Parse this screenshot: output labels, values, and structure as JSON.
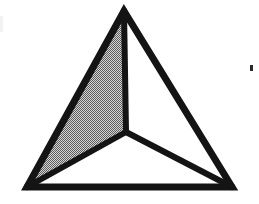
{
  "figure": {
    "background_color": "#ffffff",
    "stroke_color": "#141414",
    "stroke_width": 7,
    "shaded_face_fill": "#9a9a9a",
    "shaded_face_pattern": "dithered-halftone-50-percent",
    "unshaded_face_fill": "#ffffff",
    "canvas": {
      "width": 259,
      "height": 204
    }
  },
  "geometry": {
    "vertices": {
      "apex": {
        "label": "apex",
        "x": 124,
        "y": 11
      },
      "bottom_left": {
        "label": "bottom-left",
        "x": 27,
        "y": 187
      },
      "bottom_right": {
        "label": "bottom-right",
        "x": 232,
        "y": 187
      },
      "interior": {
        "label": "interior",
        "x": 126,
        "y": 132
      }
    },
    "outer_triangle": "124,11 232,187 27,187",
    "left_face": "124,11 126,132 27,187",
    "right_face": "124,11 232,187 126,132",
    "bottom_face": "27,187 126,132 232,187",
    "edges": [
      {
        "name": "edge-apex-to-bottom-left",
        "from": "apex",
        "to": "bottom_left",
        "x1": 124,
        "y1": 11,
        "x2": 27,
        "y2": 187
      },
      {
        "name": "edge-apex-to-bottom-right",
        "from": "apex",
        "to": "bottom_right",
        "x1": 124,
        "y1": 11,
        "x2": 232,
        "y2": 187
      },
      {
        "name": "edge-bottom-left-to-bottom-right",
        "from": "bottom_left",
        "to": "bottom_right",
        "x1": 27,
        "y1": 187,
        "x2": 232,
        "y2": 187
      },
      {
        "name": "edge-apex-to-interior",
        "from": "apex",
        "to": "interior",
        "x1": 124,
        "y1": 11,
        "x2": 126,
        "y2": 132
      },
      {
        "name": "edge-interior-to-bottom-left",
        "from": "interior",
        "to": "bottom_left",
        "x1": 126,
        "y1": 132,
        "x2": 27,
        "y2": 187
      },
      {
        "name": "edge-interior-to-bottom-right",
        "from": "interior",
        "to": "bottom_right",
        "x1": 126,
        "y1": 132,
        "x2": 232,
        "y2": 187
      }
    ]
  },
  "artifacts": {
    "right_speck": {
      "label": "scan speck",
      "x": 250,
      "y": 65,
      "width": 3,
      "height": 6,
      "color": "#2b2b2b"
    },
    "left_edge_mark": {
      "label": "faint scan mark",
      "x": 0,
      "y": 16,
      "width": 3,
      "height": 16,
      "color": "#f2f2f2"
    }
  },
  "labels": {
    "none": ""
  }
}
